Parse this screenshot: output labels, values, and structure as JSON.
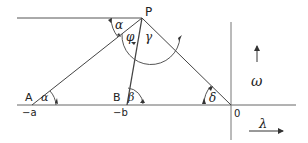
{
  "diagram": {
    "points": {
      "P": "P",
      "A": "A",
      "B": "B",
      "O": "0"
    },
    "axis_labels": {
      "A_coord": "−a",
      "B_coord": "−b",
      "horizontal_axis": "λ",
      "vertical_axis": "ω"
    },
    "angles": {
      "alpha_top": "α",
      "alpha_A": "α",
      "phi": "φ",
      "gamma": "γ",
      "beta": "β",
      "delta": "δ"
    },
    "colors": {
      "line": "#444444",
      "background": "#ffffff"
    }
  }
}
